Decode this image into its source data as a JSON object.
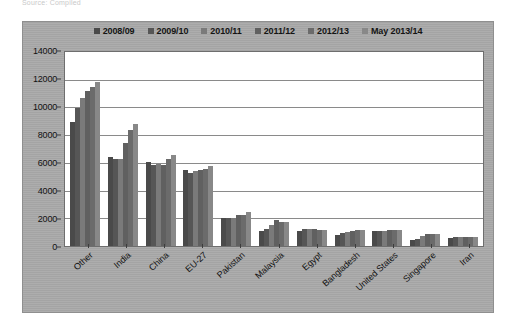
{
  "source_note": "Source: Compiled",
  "chart_data": {
    "type": "bar",
    "title": "",
    "subtitle": "",
    "xlabel": "",
    "ylabel": "",
    "ylim": [
      0,
      14000
    ],
    "ytick_step": 2000,
    "yticks": [
      "14000",
      "12000",
      "10000",
      "8000",
      "6000",
      "4000",
      "2000",
      "0"
    ],
    "grid": true,
    "legend_position": "top",
    "categories": [
      "Other",
      "India",
      "China",
      "EU-27",
      "Pakistan",
      "Malaysia",
      "Egypt",
      "Bangladesh",
      "United States",
      "Singapore",
      "Iran"
    ],
    "series": [
      {
        "name": "2008/09",
        "color": "#4a4a4a",
        "values": [
          8950,
          6400,
          6050,
          5450,
          2000,
          1100,
          1050,
          780,
          1050,
          400,
          570
        ]
      },
      {
        "name": "2009/10",
        "color": "#565656",
        "values": [
          9950,
          6300,
          5850,
          5250,
          2000,
          1250,
          1200,
          950,
          1100,
          480,
          650
        ]
      },
      {
        "name": "2010/11",
        "color": "#7a7a7a",
        "values": [
          10650,
          6300,
          5900,
          5400,
          2050,
          1500,
          1200,
          980,
          1100,
          720,
          650
        ]
      },
      {
        "name": "2011/12",
        "color": "#606060",
        "values": [
          11200,
          7450,
          5850,
          5450,
          2250,
          1900,
          1200,
          1080,
          1150,
          880,
          680
        ]
      },
      {
        "name": "2012/13",
        "color": "#6b6b6b",
        "values": [
          11500,
          8400,
          6250,
          5550,
          2250,
          1700,
          1150,
          1150,
          1180,
          880,
          680
        ]
      },
      {
        "name": "May 2013/14",
        "color": "#888888",
        "values": [
          11850,
          8800,
          6550,
          5750,
          2450,
          1700,
          1180,
          1150,
          1180,
          880,
          680
        ]
      }
    ]
  }
}
